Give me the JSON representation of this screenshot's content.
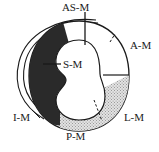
{
  "figure": {
    "type": "cardiac-short-axis-myocardial-segment-diagram",
    "background_color": "#ffffff",
    "outline_color": "#1a1a1a",
    "labels": [
      {
        "key": "as_m",
        "text": "AS-M",
        "name": "anteroseptal-mid",
        "position": "top",
        "x": 62,
        "y": 2,
        "leader": "vertical-tick"
      },
      {
        "key": "a_m",
        "text": "A-M",
        "name": "anterior-mid",
        "position": "upper-right",
        "x": 130,
        "y": 40,
        "leader": "dashed"
      },
      {
        "key": "l_m",
        "text": "L-M",
        "name": "lateral-mid",
        "position": "lower-right",
        "x": 124,
        "y": 112,
        "leader": "none"
      },
      {
        "key": "p_m",
        "text": "P-M",
        "name": "posterior-mid",
        "position": "bottom",
        "x": 66,
        "y": 131,
        "leader": "dashed"
      },
      {
        "key": "i_m",
        "text": "I-M",
        "name": "inferior-mid",
        "position": "lower-left",
        "x": 13,
        "y": 112,
        "leader": "line"
      },
      {
        "key": "s_m",
        "text": "S-M",
        "name": "septal-mid",
        "position": "center-left",
        "x": 63,
        "y": 59,
        "leader": "line"
      }
    ],
    "regions": [
      {
        "key": "septal",
        "label": "S-M",
        "fill": "#2a2a2a",
        "style": "solid-dark"
      },
      {
        "key": "lateral",
        "label": "L-M",
        "fill": "#d8d8d8",
        "style": "stippled"
      },
      {
        "key": "posterior",
        "label": "P-M",
        "fill": "#d8d8d8",
        "style": "stippled"
      },
      {
        "key": "anterior",
        "label": "A-M",
        "fill": "#ffffff",
        "style": "plain"
      },
      {
        "key": "anteroseptal",
        "label": "AS-M",
        "fill": "#ffffff",
        "style": "plain"
      },
      {
        "key": "inferior",
        "label": "I-M",
        "fill": "#ffffff",
        "style": "plain"
      }
    ],
    "colors": {
      "dark_fill": "#2a2a2a",
      "stipple_fill": "#d9d9d9",
      "stipple_dot": "#8f8f8f",
      "cavity": "#ffffff",
      "stroke": "#1a1a1a"
    }
  }
}
